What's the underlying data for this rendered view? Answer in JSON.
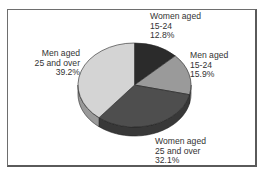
{
  "chart_data": {
    "type": "pie",
    "style": "3d",
    "title": "",
    "start_angle": "12 o'clock, clockwise",
    "categories": [
      "Women aged 15-24",
      "Men aged 15-24",
      "Women aged 25 and over",
      "Men aged 25 and over"
    ],
    "values": [
      12.8,
      15.9,
      32.1,
      39.2
    ],
    "unit": "%",
    "colors": [
      "#2b2b2b",
      "#9a9a9a",
      "#4e4e4e",
      "#d4d4d4"
    ],
    "legend": "none (direct labels)"
  },
  "labels": {
    "women_15_24": {
      "line1": "Women aged",
      "line2": "15-24",
      "line3": "12.8%"
    },
    "men_15_24": {
      "line1": "Men aged",
      "line2": "15-24",
      "line3": "15.9%"
    },
    "women_25_over": {
      "line1": "Women aged",
      "line2": "25 and over",
      "line3": "32.1%"
    },
    "men_25_over": {
      "line1": "Men aged",
      "line2": "25 and over",
      "line3": "39.2%"
    }
  }
}
